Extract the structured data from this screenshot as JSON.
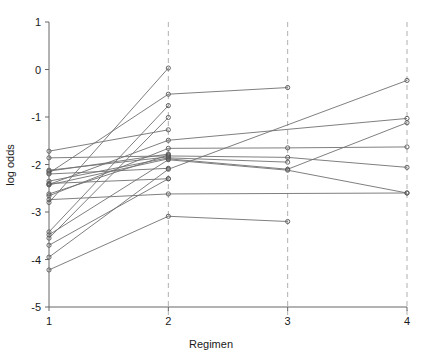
{
  "chart_data": {
    "type": "line",
    "title": "",
    "subtitle": "",
    "xlabel": "Regimen",
    "ylabel": "log odds",
    "xlim": [
      1,
      4
    ],
    "ylim": [
      -5,
      1
    ],
    "x_ticks": [
      1,
      2,
      3,
      4
    ],
    "x_tick_labels": [
      "1",
      "2",
      "3",
      "4"
    ],
    "y_ticks": [
      1,
      0,
      -1,
      -2,
      -3,
      -4,
      -5
    ],
    "y_tick_labels": [
      "1",
      "0",
      "-1",
      "-2",
      "-3",
      "-4",
      "-5"
    ],
    "grid": "vertical-dashed-at-x-2-3-4",
    "legend": "none",
    "marker": "open-circle",
    "line_color": "#707070",
    "marker_color": "#555555",
    "gridline_color": "#b0b0b0",
    "axis_color": "#666666",
    "annotations": [],
    "series": [
      {
        "name": "subject-01",
        "x": [
          1,
          2
        ],
        "values": [
          -2.8,
          0.03
        ]
      },
      {
        "name": "subject-02",
        "x": [
          1,
          2,
          3
        ],
        "values": [
          -2.18,
          -0.52,
          -0.38
        ]
      },
      {
        "name": "subject-03",
        "x": [
          1,
          2
        ],
        "values": [
          -3.42,
          -0.76
        ]
      },
      {
        "name": "subject-04",
        "x": [
          1,
          2
        ],
        "values": [
          -3.55,
          -1.01
        ]
      },
      {
        "name": "subject-05",
        "x": [
          1,
          2
        ],
        "values": [
          -1.72,
          -1.27
        ]
      },
      {
        "name": "subject-06",
        "x": [
          1,
          2,
          4
        ],
        "values": [
          -2.42,
          -1.49,
          -1.03
        ]
      },
      {
        "name": "subject-07",
        "x": [
          1,
          2,
          3,
          4
        ],
        "values": [
          -2.66,
          -1.66,
          -1.65,
          -1.63
        ]
      },
      {
        "name": "subject-08",
        "x": [
          1,
          2
        ],
        "values": [
          -2.14,
          -1.78
        ]
      },
      {
        "name": "subject-09",
        "x": [
          1,
          2,
          3,
          4
        ],
        "values": [
          -1.86,
          -1.82,
          -1.85,
          -2.06
        ]
      },
      {
        "name": "subject-10",
        "x": [
          1,
          2,
          3
        ],
        "values": [
          -2.35,
          -1.86,
          -1.95
        ]
      },
      {
        "name": "subject-11",
        "x": [
          1,
          2,
          3,
          4
        ],
        "values": [
          -2.43,
          -1.88,
          -2.1,
          -1.12
        ]
      },
      {
        "name": "subject-12",
        "x": [
          1,
          2,
          3,
          4
        ],
        "values": [
          -3.48,
          -1.9,
          -2.12,
          -2.6
        ]
      },
      {
        "name": "subject-13",
        "x": [
          1,
          2
        ],
        "values": [
          -2.2,
          -2.08
        ]
      },
      {
        "name": "subject-14",
        "x": [
          1,
          2,
          4
        ],
        "values": [
          -3.95,
          -2.1,
          -0.23
        ]
      },
      {
        "name": "subject-15",
        "x": [
          1,
          2
        ],
        "values": [
          -2.4,
          -2.3
        ]
      },
      {
        "name": "subject-16",
        "x": [
          1,
          2,
          4
        ],
        "values": [
          -2.74,
          -2.62,
          -2.6
        ]
      },
      {
        "name": "subject-17",
        "x": [
          1,
          2,
          3
        ],
        "values": [
          -4.22,
          -3.09,
          -3.2
        ]
      },
      {
        "name": "subject-18",
        "x": [
          1,
          2
        ],
        "values": [
          -3.7,
          -2.3
        ]
      },
      {
        "name": "subject-19",
        "x": [
          1,
          2
        ],
        "values": [
          -2.62,
          -1.8
        ]
      },
      {
        "name": "subject-20",
        "x": [
          1,
          2
        ],
        "values": [
          -2.12,
          -1.84
        ]
      }
    ]
  },
  "axes": {
    "x_title": "Regimen",
    "y_title": "log odds"
  }
}
